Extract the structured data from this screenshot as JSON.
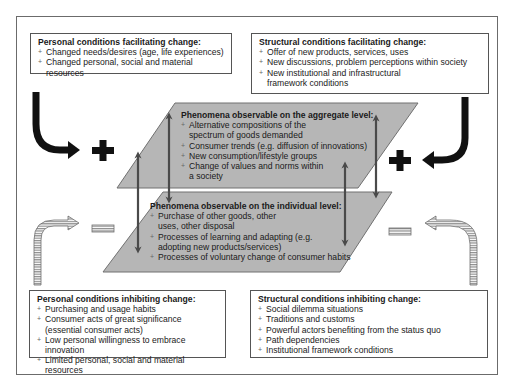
{
  "diagram": {
    "personal_facilitating": {
      "title": "Personal conditions facilitating change:",
      "items": [
        "Changed needs/desires (age, life experiences)",
        "Changed personal, social and material resources"
      ]
    },
    "structural_facilitating": {
      "title": "Structural conditions facilitating change:",
      "items": [
        "Offer of new products, services, uses",
        "New discussions, problem perceptions within society",
        "New institutional and infrastructural framework conditions"
      ]
    },
    "aggregate_level": {
      "title": "Phenomena observable on the aggregate level:",
      "items": [
        "Alternative compositions of the spectrum of goods demanded",
        "Consumer trends (e.g. diffusion of innovations)",
        "New consumption/lifestyle groups",
        "Change of values and norms within a society"
      ]
    },
    "individual_level": {
      "title": "Phenomena observable on the individual level:",
      "items": [
        "Purchase of other goods, other uses, other disposal",
        "Processes of learning and adapting (e.g. adopting new products/services)",
        "Processes of voluntary change of consumer habits"
      ]
    },
    "personal_inhibiting": {
      "title": "Personal conditions inhibiting change:",
      "items": [
        "Purchasing and usage habits",
        "Consumer acts of great significance (essential consumer acts)",
        "Low personal willingness to embrace innovation",
        "Limited personal, social and material resources"
      ]
    },
    "structural_inhibiting": {
      "title": "Structural conditions inhibiting change:",
      "items": [
        "Social dilemma situations",
        "Traditions and customs",
        "Powerful actors benefiting from the status quo",
        "Path dependencies",
        "Institutional framework conditions"
      ]
    },
    "signs": {
      "positive": "plus",
      "negative": "minus"
    },
    "colors": {
      "plane_fill": "#b4b4b4",
      "plane_stroke": "#6e6e6e",
      "arrow_dark": "#111111",
      "arrow_double": "#4a4a4a",
      "hatched_arrow": "#a0a0a0"
    }
  }
}
